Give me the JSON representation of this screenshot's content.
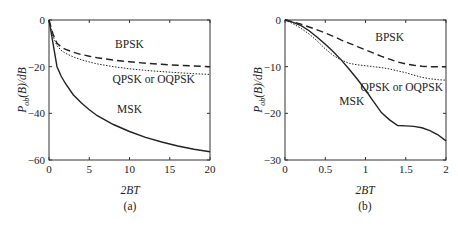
{
  "chart_data": [
    {
      "type": "line",
      "panel_label": "(a)",
      "title": "",
      "xlabel": "2BT",
      "ylabel": "P_ob(B)/dB",
      "ylabel_main": "P",
      "ylabel_sub": "ob",
      "ylabel_rest": "(B)/dB",
      "xlim": [
        0,
        20
      ],
      "ylim": [
        -60,
        0
      ],
      "x_ticks": [
        0,
        5,
        10,
        15,
        20
      ],
      "x_tick_labels": [
        "0",
        "5",
        "10",
        "15",
        "20"
      ],
      "y_ticks": [
        0,
        -20,
        -40,
        -60
      ],
      "y_tick_labels": [
        "0",
        "−20",
        "−40",
        "−60"
      ],
      "grid": false,
      "legend": "inline labels",
      "x": [
        0,
        0.5,
        1,
        1.5,
        2,
        3,
        4,
        5,
        6,
        8,
        10,
        12,
        14,
        16,
        18,
        20
      ],
      "series": [
        {
          "name": "BPSK",
          "style": "dashed",
          "values": [
            0,
            -6,
            -10,
            -11.5,
            -12.5,
            -13.8,
            -14.8,
            -15.5,
            -16.2,
            -17.2,
            -17.9,
            -18.5,
            -19,
            -19.4,
            -19.7,
            -20
          ]
        },
        {
          "name": "QPSK or OQPSK",
          "style": "dotted",
          "values": [
            0,
            -7,
            -11,
            -13,
            -14.2,
            -15.8,
            -17,
            -18,
            -18.8,
            -20,
            -20.9,
            -21.6,
            -22.1,
            -22.6,
            -23,
            -23.3
          ]
        },
        {
          "name": "MSK",
          "style": "solid",
          "values": [
            0,
            -10,
            -20,
            -24,
            -27,
            -32,
            -35.5,
            -38.5,
            -41,
            -44.8,
            -47.8,
            -50.3,
            -52.3,
            -54,
            -55.4,
            -56.5
          ]
        }
      ],
      "annotations": [
        {
          "text": "BPSK",
          "x": 10,
          "y": -12
        },
        {
          "text": "QPSK or OQPSK",
          "x": 13,
          "y": -27
        },
        {
          "text": "MSK",
          "x": 10,
          "y": -40
        }
      ]
    },
    {
      "type": "line",
      "panel_label": "(b)",
      "title": "",
      "xlabel": "2BT",
      "ylabel": "P_ob(B)/dB",
      "ylabel_main": "P",
      "ylabel_sub": "ob",
      "ylabel_rest": "(B)/dB",
      "xlim": [
        0,
        2
      ],
      "ylim": [
        -30,
        0
      ],
      "x_ticks": [
        0,
        0.5,
        1,
        1.5,
        2
      ],
      "x_tick_labels": [
        "0",
        "0.5",
        "1",
        "1.5",
        "2"
      ],
      "y_ticks": [
        0,
        -10,
        -20,
        -30
      ],
      "y_tick_labels": [
        "0",
        "−10",
        "−20",
        "−30"
      ],
      "grid": false,
      "legend": "inline labels",
      "x": [
        0,
        0.1,
        0.2,
        0.3,
        0.4,
        0.5,
        0.6,
        0.7,
        0.8,
        0.9,
        1.0,
        1.1,
        1.2,
        1.3,
        1.4,
        1.5,
        1.6,
        1.7,
        1.8,
        1.9,
        2.0
      ],
      "series": [
        {
          "name": "BPSK",
          "style": "dashed",
          "values": [
            0,
            -0.4,
            -0.9,
            -1.5,
            -2.1,
            -2.8,
            -3.5,
            -4.3,
            -5.0,
            -5.7,
            -6.4,
            -7.1,
            -7.8,
            -8.4,
            -9.0,
            -9.4,
            -9.7,
            -9.9,
            -10.0,
            -10.0,
            -10.0
          ]
        },
        {
          "name": "QPSK or OQPSK",
          "style": "dotted",
          "values": [
            0,
            -0.8,
            -1.8,
            -3.0,
            -4.5,
            -6.2,
            -7.6,
            -8.6,
            -9.3,
            -9.6,
            -9.8,
            -10.0,
            -10.2,
            -10.5,
            -10.9,
            -11.3,
            -11.8,
            -12.3,
            -12.6,
            -12.8,
            -12.9
          ]
        },
        {
          "name": "MSK",
          "style": "solid",
          "values": [
            0,
            -0.5,
            -1.2,
            -2.3,
            -3.7,
            -5.2,
            -6.8,
            -8.6,
            -10.6,
            -12.7,
            -15.0,
            -17.5,
            -19.9,
            -21.4,
            -22.6,
            -22.7,
            -22.8,
            -23.1,
            -23.7,
            -24.6,
            -25.9
          ]
        }
      ],
      "annotations": [
        {
          "text": "BPSK",
          "x": 1.3,
          "y": -4.5
        },
        {
          "text": "QPSK or OQPSK",
          "x": 1.45,
          "y": -15.3
        },
        {
          "text": "MSK",
          "x": 0.83,
          "y": -18.2
        }
      ]
    }
  ]
}
